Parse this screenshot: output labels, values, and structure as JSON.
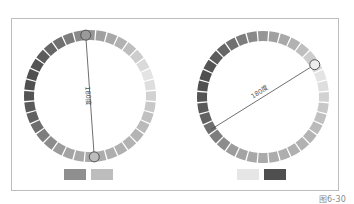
{
  "figure": {
    "caption": "图6-30"
  },
  "wheels": [
    {
      "name": "left-wheel",
      "center": [
        90,
        96
      ],
      "outer_radius": 66,
      "ring_width": 10,
      "segments": 36,
      "line_start_angle_deg": -4,
      "line_end_angle_deg": 176,
      "angle_label": "180度",
      "marker_start": {
        "fill": "#9a9a9a",
        "stroke": "#555555"
      },
      "marker_end": {
        "fill": "#bcbcbc",
        "stroke": "#555555"
      },
      "swatches": [
        {
          "color": "#8f8f8f",
          "x": 64,
          "y": 169
        },
        {
          "color": "#bdbdbd",
          "x": 91,
          "y": 169
        }
      ]
    },
    {
      "name": "right-wheel",
      "center": [
        263,
        97
      ],
      "outer_radius": 66,
      "ring_width": 10,
      "segments": 36,
      "line_start_angle_deg": 58,
      "line_end_angle_deg": 238,
      "angle_label": "180度",
      "marker_start": {
        "fill": "#ededed",
        "stroke": "#555555"
      },
      "marker_end": null,
      "swatches": [
        {
          "color": "#e6e6e6",
          "x": 237,
          "y": 169
        },
        {
          "color": "#4f4f4f",
          "x": 264,
          "y": 169
        }
      ]
    }
  ],
  "segment_gray_levels": [
    150,
    160,
    168,
    178,
    190,
    205,
    218,
    228,
    222,
    210,
    200,
    192,
    186,
    180,
    178,
    176,
    174,
    172,
    170,
    168,
    164,
    156,
    140,
    125,
    110,
    98,
    90,
    84,
    80,
    80,
    84,
    92,
    102,
    112,
    124,
    138
  ]
}
